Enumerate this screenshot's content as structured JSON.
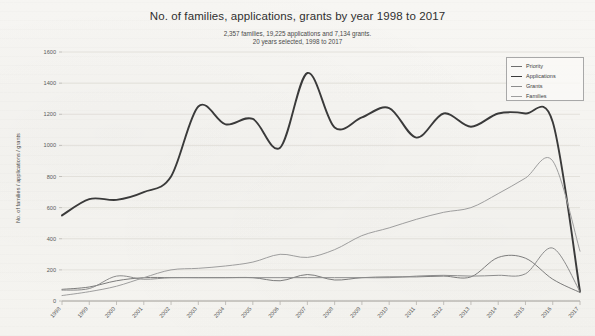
{
  "chart_title": "No. of families, applications, grants by year 1998 to 2017",
  "subtitle_line_1": "2,357 families, 19,225 applications and 7,134 grants.",
  "subtitle_line_2": "20 years selected, 1998 to 2017",
  "y_axis_title": "No. of families / applications / grants",
  "legend": {
    "position": "top-right",
    "items": [
      {
        "label": "Priority",
        "color": "#6e6e6e",
        "width": 0.9
      },
      {
        "label": "Applications",
        "color": "#3a3a3a",
        "width": 1.9
      },
      {
        "label": "Grants",
        "color": "#8c8c8c",
        "width": 1.0
      },
      {
        "label": "Families",
        "color": "#9e9e9e",
        "width": 1.0
      }
    ]
  },
  "chart_data": {
    "type": "line",
    "title": "No. of families, applications, grants by year 1998 to 2017",
    "subtitle": "2,357 families, 19,225 applications and 7,134 grants. 20 years selected, 1998 to 2017",
    "xlabel": "",
    "ylabel": "No. of families / applications / grants",
    "x": [
      1998,
      1999,
      2000,
      2001,
      2002,
      2003,
      2004,
      2005,
      2006,
      2007,
      2008,
      2009,
      2010,
      2011,
      2012,
      2013,
      2014,
      2015,
      2016,
      2017
    ],
    "categories": [
      "1998",
      "1999",
      "2000",
      "2001",
      "2002",
      "2003",
      "2004",
      "2005",
      "2006",
      "2007",
      "2008",
      "2009",
      "2010",
      "2011",
      "2012",
      "2013",
      "2014",
      "2015",
      "2016",
      "2017"
    ],
    "ylim": [
      0,
      1600
    ],
    "xlim": [
      1998,
      2017
    ],
    "yticks": [
      0,
      200,
      400,
      600,
      800,
      1000,
      1200,
      1400,
      1600
    ],
    "ytick_labels": [
      "0",
      "200",
      "400",
      "600",
      "800",
      "1000",
      "1200",
      "1400",
      "1600"
    ],
    "grid": "horizontal",
    "legend_position": "top-right",
    "series": [
      {
        "name": "Priority",
        "color": "#6e6e6e",
        "values": [
          75,
          90,
          130,
          150,
          150,
          150,
          150,
          150,
          130,
          170,
          135,
          150,
          155,
          155,
          160,
          155,
          280,
          275,
          140,
          55
        ]
      },
      {
        "name": "Applications",
        "color": "#3a3a3a",
        "values": [
          550,
          655,
          650,
          700,
          800,
          1250,
          1135,
          1170,
          985,
          1465,
          1115,
          1180,
          1240,
          1050,
          1205,
          1120,
          1205,
          1205,
          1150,
          60
        ]
      },
      {
        "name": "Grants",
        "color": "#8c8c8c",
        "values": [
          70,
          80,
          160,
          140,
          150,
          150,
          150,
          150,
          150,
          150,
          150,
          150,
          150,
          160,
          165,
          160,
          165,
          175,
          340,
          60
        ]
      },
      {
        "name": "Families",
        "color": "#9e9e9e",
        "values": [
          35,
          60,
          95,
          150,
          200,
          210,
          225,
          250,
          300,
          280,
          330,
          420,
          470,
          525,
          570,
          600,
          690,
          790,
          900,
          320
        ]
      }
    ]
  }
}
